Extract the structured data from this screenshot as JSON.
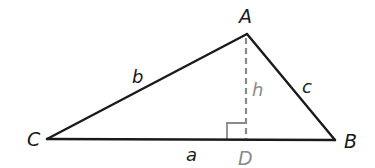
{
  "diagram": {
    "type": "triangle-with-altitude",
    "colors": {
      "side": "#1a1a1a",
      "altitude": "#8a8a8a",
      "label": "#1a1a1a",
      "altitude_label": "#8a8a8a",
      "foot_label": "#8a8a8a"
    },
    "vertices": {
      "A": {
        "label": "A",
        "x": 247,
        "y": 34
      },
      "B": {
        "label": "B",
        "x": 335,
        "y": 140
      },
      "C": {
        "label": "C",
        "x": 47,
        "y": 139
      },
      "D": {
        "label": "D",
        "x": 246,
        "y": 140
      }
    },
    "sides": {
      "a": {
        "label": "a",
        "from": "C",
        "to": "B"
      },
      "b": {
        "label": "b",
        "from": "C",
        "to": "A"
      },
      "c": {
        "label": "c",
        "from": "A",
        "to": "B"
      }
    },
    "altitude": {
      "label": "h",
      "from": "A",
      "to": "D",
      "style": "dashed"
    },
    "right_angle_marker": {
      "at": "D",
      "size": 18
    }
  }
}
